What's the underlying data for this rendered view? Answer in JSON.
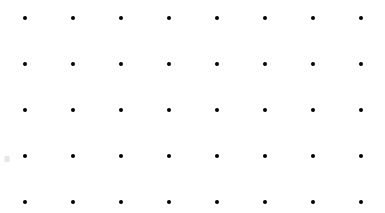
{
  "canvas": {
    "width": 385,
    "height": 213,
    "background_color": "#ffffff",
    "description": "Regular rectangular array of small black dots on a plain white background"
  },
  "grid": {
    "columns": 8,
    "rows": 5,
    "total_dots": 40,
    "column_spacing": 48,
    "row_spacing": 46,
    "origin_x": 25,
    "origin_y": 18,
    "dot_color": "#000000",
    "dot_diameter": 4,
    "dot_shape": "circle",
    "column_x": [
      25,
      73,
      121,
      169,
      217,
      265,
      313,
      361
    ],
    "row_y": [
      18,
      64,
      110,
      156,
      202
    ]
  },
  "artifacts": [
    {
      "name": "left-edge-smudge",
      "x": 7,
      "y": 159,
      "color": "#e2e2e2",
      "width": 5,
      "height": 6
    }
  ]
}
